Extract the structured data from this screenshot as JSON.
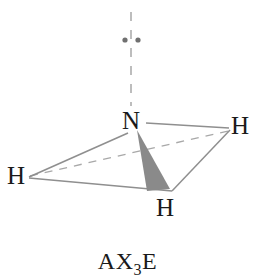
{
  "figure": {
    "caption": {
      "prefix": "AX",
      "subscript": "3",
      "suffix": "E"
    },
    "background_color": "#ffffff",
    "line_color": "#9a9a9a",
    "wedge_color": "#8a8a8a",
    "label_color": "#1a1a1a"
  },
  "atoms": {
    "central": {
      "label": "N",
      "x": 134,
      "y": 121
    },
    "hydrogen_right": {
      "label": "H",
      "x": 239,
      "y": 126
    },
    "hydrogen_left": {
      "label": "H",
      "x": 16,
      "y": 176
    },
    "hydrogen_bottom": {
      "label": "H",
      "x": 165,
      "y": 208
    }
  },
  "lone_pair": {
    "name": "lone-pair-electrons",
    "dot_left_x": 125,
    "dot_right_x": 138,
    "dot_y": 40,
    "dot_radius": 2.6,
    "dot_color": "#707070",
    "axis_x": 131,
    "axis_top_y": 12,
    "axis_bottom_y": 106
  },
  "bonds": [
    {
      "name": "bond-n-to-h-right",
      "style": "solid",
      "x1": 146,
      "y1": 123,
      "x2": 229,
      "y2": 128
    },
    {
      "name": "bond-n-to-h-left",
      "style": "solid",
      "x1": 128,
      "y1": 132,
      "x2": 29,
      "y2": 177
    },
    {
      "name": "bond-n-to-h-bottom",
      "style": "wedge",
      "apex_x": 137,
      "apex_y": 131,
      "base_left_x": 147,
      "base_left_y": 191,
      "base_right_x": 170,
      "base_right_y": 189
    },
    {
      "name": "base-edge-left-to-bottom",
      "style": "solid",
      "x1": 29,
      "y1": 178,
      "x2": 171,
      "y2": 191
    },
    {
      "name": "base-edge-bottom-to-right",
      "style": "solid",
      "x1": 172,
      "y1": 191,
      "x2": 230,
      "y2": 130
    },
    {
      "name": "base-edge-left-to-right-hidden",
      "style": "dashed",
      "x1": 30,
      "y1": 176,
      "x2": 228,
      "y2": 131
    }
  ]
}
